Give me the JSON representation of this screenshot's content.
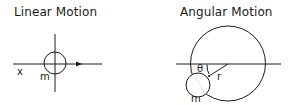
{
  "panels": [
    {
      "title": "Linear Motion",
      "labels": {
        "axis": "x",
        "mass": "m"
      }
    },
    {
      "title": "Angular Motion",
      "labels": {
        "angle": "θ",
        "radius": "r",
        "mass": "m"
      }
    }
  ],
  "colors": {
    "stroke": "#1a1a1a",
    "background": "#ffffff"
  }
}
